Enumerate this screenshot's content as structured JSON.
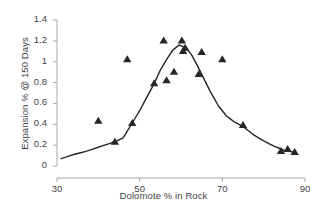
{
  "chart_data": {
    "type": "scatter",
    "title": "",
    "xlabel": "Dolomote % in Rock",
    "ylabel": "Expansion % @ 150 Days",
    "xlim": [
      30,
      90
    ],
    "ylim": [
      0,
      1.4
    ],
    "xticks": [
      "30",
      "50",
      "70",
      "90"
    ],
    "xtick_values": [
      30,
      50,
      70,
      90
    ],
    "yticks": [
      "0",
      "0.2",
      "0.4",
      "0.6",
      "0.8",
      "1",
      "1.2",
      "1.4"
    ],
    "ytick_values": [
      0,
      0.2,
      0.4,
      0.6,
      0.8,
      1,
      1.2,
      1.4
    ],
    "grid": false,
    "legend": false,
    "marker": "triangle",
    "marker_color": "#262626",
    "line_color": "#262626",
    "axis_color": "#a6a6a6",
    "points": [
      {
        "x": 40.0,
        "y": 0.43
      },
      {
        "x": 44.0,
        "y": 0.23
      },
      {
        "x": 47.0,
        "y": 1.02
      },
      {
        "x": 48.2,
        "y": 0.41
      },
      {
        "x": 53.5,
        "y": 0.79
      },
      {
        "x": 55.8,
        "y": 1.2
      },
      {
        "x": 56.5,
        "y": 0.82
      },
      {
        "x": 58.3,
        "y": 0.9
      },
      {
        "x": 60.2,
        "y": 1.2
      },
      {
        "x": 60.5,
        "y": 1.1
      },
      {
        "x": 61.0,
        "y": 1.13
      },
      {
        "x": 64.3,
        "y": 0.88
      },
      {
        "x": 65.0,
        "y": 1.09
      },
      {
        "x": 70.0,
        "y": 1.02
      },
      {
        "x": 75.0,
        "y": 0.39
      },
      {
        "x": 84.2,
        "y": 0.14
      },
      {
        "x": 85.8,
        "y": 0.16
      },
      {
        "x": 87.5,
        "y": 0.13
      }
    ],
    "fit_curve": [
      {
        "x": 31.0,
        "y": 0.07
      },
      {
        "x": 34.0,
        "y": 0.11
      },
      {
        "x": 37.0,
        "y": 0.14
      },
      {
        "x": 40.0,
        "y": 0.18
      },
      {
        "x": 43.0,
        "y": 0.22
      },
      {
        "x": 44.5,
        "y": 0.24
      },
      {
        "x": 46.0,
        "y": 0.27
      },
      {
        "x": 48.0,
        "y": 0.4
      },
      {
        "x": 50.0,
        "y": 0.53
      },
      {
        "x": 52.0,
        "y": 0.68
      },
      {
        "x": 53.5,
        "y": 0.79
      },
      {
        "x": 55.0,
        "y": 0.92
      },
      {
        "x": 56.5,
        "y": 1.02
      },
      {
        "x": 58.0,
        "y": 1.11
      },
      {
        "x": 59.5,
        "y": 1.16
      },
      {
        "x": 61.0,
        "y": 1.14
      },
      {
        "x": 62.5,
        "y": 1.07
      },
      {
        "x": 64.0,
        "y": 0.96
      },
      {
        "x": 65.5,
        "y": 0.84
      },
      {
        "x": 67.0,
        "y": 0.72
      },
      {
        "x": 69.0,
        "y": 0.58
      },
      {
        "x": 71.0,
        "y": 0.48
      },
      {
        "x": 73.0,
        "y": 0.42
      },
      {
        "x": 75.0,
        "y": 0.38
      },
      {
        "x": 77.5,
        "y": 0.3
      },
      {
        "x": 80.0,
        "y": 0.24
      },
      {
        "x": 82.5,
        "y": 0.19
      },
      {
        "x": 85.0,
        "y": 0.15
      },
      {
        "x": 87.5,
        "y": 0.13
      }
    ]
  }
}
